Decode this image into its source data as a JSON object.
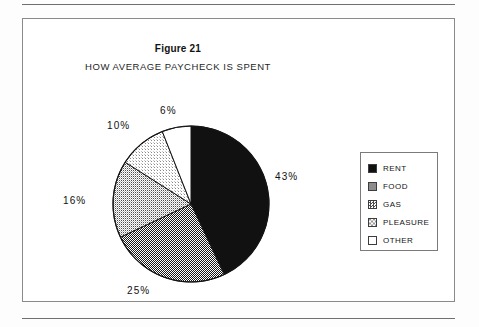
{
  "figure": {
    "title": "Figure 21",
    "subtitle": "HOW AVERAGE PAYCHECK IS SPENT"
  },
  "legend": {
    "items": [
      {
        "label": "RENT",
        "color": "#111111"
      },
      {
        "label": "FOOD",
        "color": "#6e6e6e"
      },
      {
        "label": "GAS",
        "color": "#b4b4b4"
      },
      {
        "label": "PLEASURE",
        "color": "#dcdcdc"
      },
      {
        "label": "OTHER",
        "color": "#ffffff"
      }
    ]
  },
  "labels": {
    "rent": "43%",
    "food": "25%",
    "gas": "16%",
    "pleasure": "10%",
    "other": "6%"
  },
  "chart_data": {
    "type": "pie",
    "title": "Figure 21",
    "subtitle": "HOW AVERAGE PAYCHECK IS SPENT",
    "categories": [
      "RENT",
      "FOOD",
      "GAS",
      "PLEASURE",
      "OTHER"
    ],
    "values": [
      43,
      25,
      16,
      10,
      6
    ],
    "value_labels": [
      "43%",
      "25%",
      "16%",
      "10%",
      "6%"
    ],
    "units": "percent",
    "total": 100,
    "start_angle_deg": 0,
    "direction": "clockwise",
    "colors": [
      "#111111",
      "#6e6e6e",
      "#b4b4b4",
      "#dcdcdc",
      "#ffffff"
    ],
    "fill_styles": [
      "solid-black",
      "dense-checker-dither",
      "medium-dither",
      "light-dither",
      "white"
    ],
    "legend": true,
    "legend_position": "right",
    "grid": false,
    "xlabel": "",
    "ylabel": ""
  }
}
